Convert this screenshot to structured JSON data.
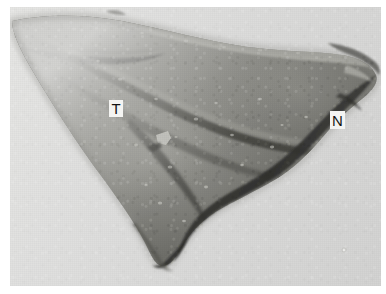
{
  "figure": {
    "kind": "grayscale-specimen-photograph",
    "background_color": "#dcdcdc",
    "specimen_tone_dark": "#4a4a48",
    "specimen_tone_mid": "#8a8a86",
    "specimen_tone_light": "#c2c2bd",
    "border_color": "#ffffff"
  },
  "labels": [
    {
      "id": "label-t",
      "text": "T",
      "meaning": "T",
      "x": 99,
      "y": 93,
      "box_background": "#f4f4f2",
      "text_color": "#141414"
    },
    {
      "id": "label-n",
      "text": "N",
      "meaning": "N",
      "x": 320,
      "y": 104,
      "box_background": "#f4f4f2",
      "text_color": "#141414"
    }
  ]
}
